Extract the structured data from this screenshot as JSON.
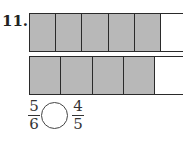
{
  "problem": {
    "number": "11.",
    "bars": [
      {
        "total_parts": 6,
        "shaded_parts": 5,
        "cell_width": 26
      },
      {
        "total_parts": 5,
        "shaded_parts": 4,
        "cell_width": 31
      }
    ],
    "comparison": {
      "left": {
        "numerator": "5",
        "denominator": "6"
      },
      "right": {
        "numerator": "4",
        "denominator": "5"
      },
      "answer_blank": ""
    }
  },
  "colors": {
    "shaded": "#b8b8b8",
    "border": "#2a2a2a"
  }
}
